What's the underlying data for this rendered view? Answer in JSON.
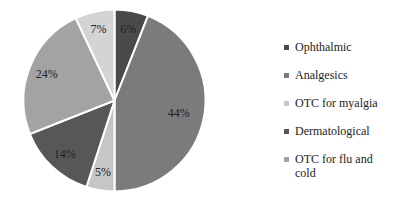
{
  "chart_data": {
    "type": "pie",
    "title": "",
    "start_angle_deg": 0,
    "direction": "clockwise",
    "slices": [
      {
        "label": "Ophthalmic",
        "value": 6,
        "display": "6%",
        "color": "#4a4a4a"
      },
      {
        "label": "Analgesics",
        "value": 44,
        "display": "44%",
        "color": "#7b7b7b"
      },
      {
        "label": "OTC for myalgia",
        "value": 5,
        "display": "5%",
        "color": "#c6c6c6"
      },
      {
        "label": "Dermatological",
        "value": 14,
        "display": "14%",
        "color": "#575757"
      },
      {
        "label": "OTC for flu and cold",
        "value": 24,
        "display": "24%",
        "color": "#a3a3a3"
      },
      {
        "label": "",
        "value": 7,
        "display": "7%",
        "color": "#d4d4d4"
      }
    ],
    "legend_position": "right"
  },
  "legend": {
    "items": [
      {
        "label": "Ophthalmic",
        "color": "#4a4a4a"
      },
      {
        "label": "Analgesics",
        "color": "#7b7b7b"
      },
      {
        "label": "OTC for myalgia",
        "color": "#c6c6c6"
      },
      {
        "label": "Dermatological",
        "color": "#575757"
      },
      {
        "label": "OTC for flu and cold",
        "color": "#a3a3a3"
      }
    ]
  }
}
